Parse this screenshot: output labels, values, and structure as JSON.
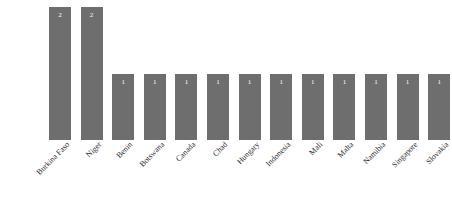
{
  "chart_data": {
    "type": "bar",
    "title": "",
    "subtitle": "",
    "xlabel": "",
    "ylabel": "",
    "ylim": [
      0,
      2
    ],
    "grid": false,
    "legend": null,
    "bar_color": "#6e6e6e",
    "background_color": "#ffffff",
    "value_label_color": "#ffffff",
    "tick_label_rotation_deg": -45,
    "categories": [
      "Burkina Faso",
      "Niger",
      "Benin",
      "Botswana",
      "Canada",
      "Chad",
      "Hungary",
      "Indonesia",
      "Mali",
      "Malta",
      "Namibia",
      "Singapore",
      "Slovakia"
    ],
    "values": [
      2,
      2,
      1,
      1,
      1,
      1,
      1,
      1,
      1,
      1,
      1,
      1,
      1
    ],
    "value_labels": [
      "2",
      "2",
      "1",
      "1",
      "1",
      "1",
      "1",
      "1",
      "1",
      "1",
      "1",
      "1",
      "1"
    ]
  }
}
